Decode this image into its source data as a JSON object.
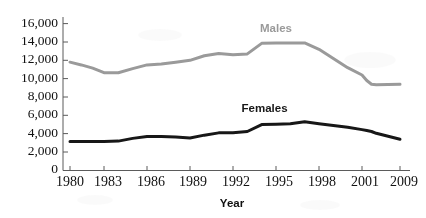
{
  "chart_data": {
    "type": "line",
    "title": "",
    "xlabel": "Year",
    "ylabel": "",
    "grid": false,
    "legend_position": "inline-on-series",
    "xlim": [
      1980,
      2009
    ],
    "ylim": [
      0,
      16000
    ],
    "y_ticks": [
      0,
      2000,
      4000,
      6000,
      8000,
      10000,
      12000,
      14000,
      16000
    ],
    "y_tick_labels": [
      "0",
      "2,000",
      "4,000",
      "6,000",
      "8,000",
      "10,000",
      "12,000",
      "14,000",
      "16,000"
    ],
    "x_ticks": [
      1980,
      1983,
      1986,
      1989,
      1992,
      1995,
      1998,
      2001,
      2009
    ],
    "x_tick_labels": [
      "1980",
      "1983",
      "1986",
      "1989",
      "1992",
      "1995",
      "1998",
      "2001",
      "2009"
    ],
    "x": [
      1980,
      1981,
      1982,
      1983,
      1984,
      1985,
      1986,
      1987,
      1988,
      1989,
      1990,
      1991,
      1992,
      1993,
      1994,
      1995,
      1996,
      1997,
      1998,
      1999,
      2000,
      2001,
      2002,
      2003,
      2004,
      2009
    ],
    "series": [
      {
        "name": "Males",
        "color": "#9a9a9a",
        "stroke_width": 3,
        "label_x": 1995.0,
        "label_y": 15050,
        "values": [
          11800,
          11500,
          11150,
          10650,
          10650,
          11100,
          11500,
          11600,
          11800,
          12000,
          12500,
          12750,
          12600,
          12700,
          13850,
          13900,
          13900,
          13900,
          13200,
          12200,
          11200,
          10400,
          9800,
          9400,
          9350,
          9400
        ]
      },
      {
        "name": "Females",
        "color": "#171717",
        "stroke_width": 3,
        "label_x": 1994.2,
        "label_y": 6350,
        "values": [
          3150,
          3150,
          3150,
          3150,
          3200,
          3500,
          3700,
          3700,
          3650,
          3550,
          3850,
          4100,
          4100,
          4250,
          5000,
          5050,
          5100,
          5300,
          5100,
          4900,
          4700,
          4450,
          4350,
          4250,
          4050,
          3400
        ]
      }
    ]
  },
  "series_labels": {
    "males": "Males",
    "females": "Females"
  },
  "axis": {
    "x_title": "Year"
  }
}
